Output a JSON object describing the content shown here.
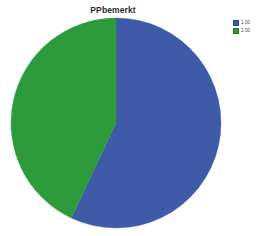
{
  "chart_data": {
    "type": "pie",
    "title": "PPbemerkt",
    "xlabel": "",
    "ylabel": "",
    "categories": [
      "1.00",
      "2.00"
    ],
    "values": [
      57,
      43
    ],
    "colors": [
      "#3f5ba8",
      "#2d9a3c"
    ],
    "legend_position": "top-right",
    "grid": false,
    "start_angle_deg": 0,
    "direction": "clockwise",
    "slices": [
      {
        "label": "1.00",
        "value": 57,
        "color": "#3f5ba8",
        "start_deg": 0,
        "end_deg": 205
      },
      {
        "label": "2.00",
        "value": 43,
        "color": "#2d9a3c",
        "start_deg": 205,
        "end_deg": 360
      }
    ]
  },
  "legend": {
    "entries": [
      {
        "label": "1.00",
        "color": "#3f5ba8"
      },
      {
        "label": "2.00",
        "color": "#2d9a3c"
      }
    ]
  },
  "colors": {
    "slice_blue": "#3f5ba8",
    "slice_green": "#2d9a3c",
    "background": "#ffffff",
    "title_text": "#2b2b2b",
    "legend_text": "#444444"
  }
}
